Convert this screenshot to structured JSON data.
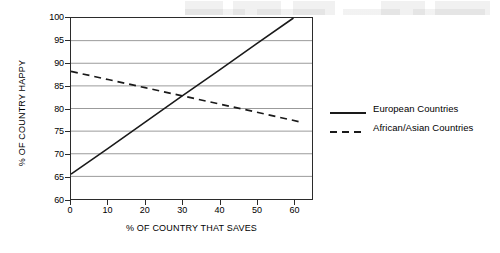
{
  "chart_data": {
    "type": "line",
    "title": "",
    "xlabel": "% OF COUNTRY THAT SAVES",
    "ylabel": "% OF COUNTRY HAPPY",
    "xlim": [
      0,
      65
    ],
    "ylim": [
      60,
      100
    ],
    "xticks": [
      0,
      10,
      20,
      30,
      40,
      50,
      60
    ],
    "yticks": [
      60,
      65,
      70,
      75,
      80,
      85,
      90,
      95,
      100
    ],
    "grid": "horizontal",
    "legend_position": "right-outside",
    "series": [
      {
        "name": "European Countries",
        "style": "solid",
        "color": "#1a1a1a",
        "x": [
          0,
          10,
          20,
          30,
          40,
          50,
          60
        ],
        "values": [
          65.5,
          71.2,
          77.0,
          82.8,
          88.5,
          94.3,
          100.0
        ]
      },
      {
        "name": "African/Asian Countries",
        "style": "dashed",
        "color": "#1a1a1a",
        "x": [
          0,
          10,
          20,
          30,
          40,
          50,
          62
        ],
        "values": [
          88.2,
          86.4,
          84.6,
          82.8,
          81.0,
          79.2,
          77.0
        ]
      }
    ]
  },
  "axes": {
    "y_title": "% OF COUNTRY HAPPY",
    "x_title": "% OF COUNTRY THAT SAVES",
    "y_tick_labels": [
      "100",
      "95",
      "90",
      "85",
      "80",
      "75",
      "70",
      "65",
      "60"
    ],
    "x_tick_labels": [
      "0",
      "10",
      "20",
      "30",
      "40",
      "50",
      "60"
    ]
  },
  "legend": {
    "items": [
      {
        "label": "European Countries",
        "style": "solid"
      },
      {
        "label": "African/Asian Countries",
        "style": "dashed"
      }
    ]
  },
  "colors": {
    "line": "#1a1a1a",
    "grid": "#9a9a9a",
    "frame": "#2b2b2b",
    "background": "#ffffff"
  }
}
